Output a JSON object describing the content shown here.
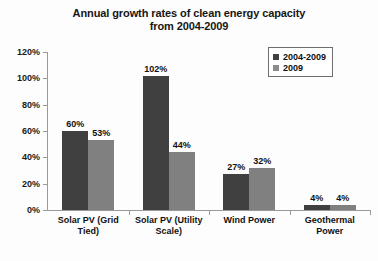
{
  "chart_data": {
    "type": "bar",
    "title": "Annual growth rates of clean energy capacity from 2004-2009",
    "title_lines": [
      "Annual growth rates of clean energy capacity",
      "from 2004-2009"
    ],
    "xlabel": "",
    "ylabel": "",
    "ylim": [
      0,
      120
    ],
    "ytick_values": [
      0,
      20,
      40,
      60,
      80,
      100,
      120
    ],
    "ytick_labels": [
      "0%",
      "20%",
      "40%",
      "60%",
      "80%",
      "100%",
      "120%"
    ],
    "grid": false,
    "legend_position": "top-right",
    "categories": [
      "Solar PV (Grid Tied)",
      "Solar PV (Utility Scale)",
      "Wind Power",
      "Geothermal Power"
    ],
    "category_label_lines": [
      [
        "Solar PV (Grid",
        "Tied)"
      ],
      [
        "Solar PV (Utility",
        "Scale)"
      ],
      [
        "Wind Power"
      ],
      [
        "Geothermal",
        "Power"
      ]
    ],
    "series": [
      {
        "name": "2004-2009",
        "color": "#404040",
        "values": [
          60,
          102,
          27,
          4
        ],
        "value_labels": [
          "60%",
          "102%",
          "27%",
          "4%"
        ]
      },
      {
        "name": "2009",
        "color": "#808080",
        "values": [
          53,
          44,
          32,
          4
        ],
        "value_labels": [
          "53%",
          "44%",
          "32%",
          "4%"
        ]
      }
    ]
  },
  "legend": {
    "items": [
      {
        "label": "2004-2009",
        "swatch": "dark-swatch-icon"
      },
      {
        "label": "2009",
        "swatch": "light-swatch-icon"
      }
    ]
  }
}
